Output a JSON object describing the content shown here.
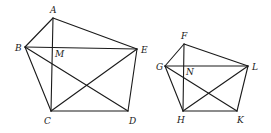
{
  "figures": [
    {
      "name": "pentagon-abcde",
      "points": {
        "A": {
          "x": 53,
          "y": 18,
          "label": "A",
          "lx": 50,
          "ly": 13
        },
        "B": {
          "x": 25,
          "y": 47,
          "label": "B",
          "lx": 15,
          "ly": 51
        },
        "C": {
          "x": 51,
          "y": 111,
          "label": "C",
          "lx": 44,
          "ly": 124
        },
        "D": {
          "x": 128,
          "y": 111,
          "label": "D",
          "lx": 129,
          "ly": 124
        },
        "E": {
          "x": 137,
          "y": 49,
          "label": "E",
          "lx": 141,
          "ly": 53
        },
        "M": {
          "x": 53,
          "y": 47,
          "label": "M",
          "lx": 55,
          "ly": 57
        }
      },
      "segments": [
        [
          "A",
          "B"
        ],
        [
          "A",
          "E"
        ],
        [
          "B",
          "C"
        ],
        [
          "C",
          "D"
        ],
        [
          "D",
          "E"
        ],
        [
          "A",
          "C"
        ],
        [
          "B",
          "E"
        ],
        [
          "B",
          "D"
        ],
        [
          "C",
          "E"
        ]
      ]
    },
    {
      "name": "pentagon-fghlk",
      "points": {
        "F": {
          "x": 184,
          "y": 44,
          "label": "F",
          "lx": 181,
          "ly": 39
        },
        "G": {
          "x": 165,
          "y": 66,
          "label": "G",
          "lx": 156,
          "ly": 70
        },
        "H": {
          "x": 183,
          "y": 111,
          "label": "H",
          "lx": 177,
          "ly": 123
        },
        "K": {
          "x": 237,
          "y": 111,
          "label": "K",
          "lx": 237,
          "ly": 123
        },
        "L": {
          "x": 248,
          "y": 66,
          "label": "L",
          "lx": 252,
          "ly": 70
        },
        "N": {
          "x": 184,
          "y": 66,
          "label": "N",
          "lx": 186,
          "ly": 75
        }
      },
      "segments": [
        [
          "F",
          "G"
        ],
        [
          "F",
          "L"
        ],
        [
          "G",
          "H"
        ],
        [
          "H",
          "K"
        ],
        [
          "K",
          "L"
        ],
        [
          "F",
          "H"
        ],
        [
          "G",
          "L"
        ],
        [
          "G",
          "K"
        ],
        [
          "H",
          "L"
        ]
      ]
    }
  ],
  "style": {
    "stroke": "#1a1a1a",
    "background": "#ffffff"
  }
}
